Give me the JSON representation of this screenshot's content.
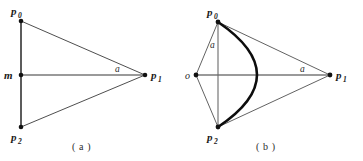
{
  "figure": {
    "panels": [
      {
        "id": "a",
        "caption": "( a )",
        "labels": {
          "p0": "p",
          "p0_sub": "0",
          "p1": "p",
          "p1_sub": "1",
          "p2": "p",
          "p2_sub": "2",
          "origin": "m",
          "distance": "a"
        },
        "geometry": {
          "p0": [
            21,
            21
          ],
          "p1": [
            145,
            75
          ],
          "p2": [
            21,
            127
          ],
          "origin": [
            21,
            75
          ],
          "vertical_axis_top": [
            21,
            20
          ],
          "vertical_axis_bottom": [
            21,
            128
          ]
        }
      },
      {
        "id": "b",
        "caption": "( b )",
        "labels": {
          "p0": "p",
          "p0_sub": "0",
          "p1": "p",
          "p1_sub": "1",
          "p2": "p",
          "p2_sub": "2",
          "origin": "o",
          "distance_left": "a",
          "distance_right": "a"
        },
        "geometry": {
          "p0": [
            218,
            22
          ],
          "p1": [
            330,
            75
          ],
          "p2": [
            218,
            127
          ],
          "origin": [
            196,
            75
          ],
          "arc_apex": [
            262,
            75
          ],
          "vertical_axis_top": [
            218,
            20
          ],
          "vertical_axis_bottom": [
            218,
            128
          ]
        }
      }
    ],
    "colors": {
      "stroke": "#2d2d2d",
      "thin_stroke": "#555555",
      "axis": "#8a8a8a",
      "curve": "#111111",
      "vertex": "#111111",
      "background": "#ffffff"
    }
  }
}
